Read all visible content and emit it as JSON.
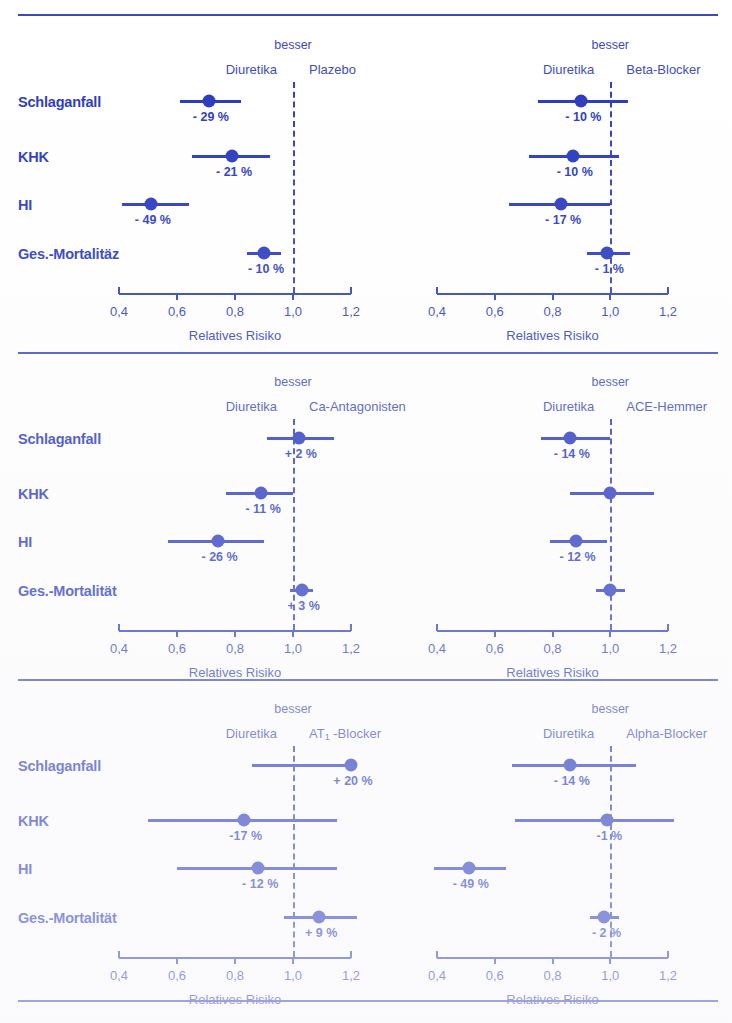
{
  "figure": {
    "x_axis_title": "Relatives Risiko",
    "better_label": "besser",
    "reference_arm": "Diuretika",
    "tick_labels": [
      "0,4",
      "0,6",
      "0,8",
      "1,0",
      "1,2"
    ],
    "tick_values": [
      0.4,
      0.6,
      0.8,
      1.0,
      1.2
    ],
    "outcomes": [
      "Schlaganfall",
      "KHK",
      "HI",
      "Ges.-Mortalität"
    ],
    "accent_color": "#2233bb",
    "text_color": "#3a46bb"
  },
  "chart_data": {
    "type": "scatter",
    "title": "",
    "xlabel": "Relatives Risiko",
    "ylabel": "",
    "xlim": [
      0.35,
      1.28
    ],
    "grid": false,
    "reference_line": 1.0,
    "legend": "none",
    "panels": [
      {
        "id": "panel-plazebo",
        "row": 1,
        "column": "left",
        "comparator": "Plazebo",
        "comparator_sub": "",
        "better_label": "besser",
        "reference_arm": "Diuretika",
        "tick_labels": [
          "0,4",
          "0,6",
          "0,8",
          "1,0",
          "1,2"
        ],
        "xlabel": "Relatives Risiko",
        "rows": [
          {
            "outcome": "Schlaganfall",
            "rr": 0.71,
            "ci_low": 0.61,
            "ci_high": 0.82,
            "label": "- 29 %"
          },
          {
            "outcome": "KHK",
            "rr": 0.79,
            "ci_low": 0.65,
            "ci_high": 0.92,
            "label": "- 21 %"
          },
          {
            "outcome": "HI",
            "rr": 0.51,
            "ci_low": 0.41,
            "ci_high": 0.64,
            "label": "- 49 %"
          },
          {
            "outcome": "Ges.-Mortalitäz",
            "rr": 0.9,
            "ci_low": 0.84,
            "ci_high": 0.96,
            "label": "- 10 %"
          }
        ]
      },
      {
        "id": "panel-beta-blocker",
        "row": 1,
        "column": "right",
        "comparator": "Beta-Blocker",
        "comparator_sub": "",
        "better_label": "besser",
        "reference_arm": "Diuretika",
        "tick_labels": [
          "0,4",
          "0,6",
          "0,8",
          "1,0",
          "1,2"
        ],
        "xlabel": "Relatives Risiko",
        "rows": [
          {
            "outcome": "Schlaganfall",
            "rr": 0.9,
            "ci_low": 0.75,
            "ci_high": 1.06,
            "label": "- 10 %"
          },
          {
            "outcome": "KHK",
            "rr": 0.87,
            "ci_low": 0.72,
            "ci_high": 1.03,
            "label": "- 10 %"
          },
          {
            "outcome": "HI",
            "rr": 0.83,
            "ci_low": 0.65,
            "ci_high": 1.0,
            "label": "- 17 %"
          },
          {
            "outcome": "Ges.-Mortalitäz",
            "rr": 0.99,
            "ci_low": 0.92,
            "ci_high": 1.07,
            "label": "- 1 %"
          }
        ]
      },
      {
        "id": "panel-ca-antagonisten",
        "row": 2,
        "column": "left",
        "comparator": "Ca-Antagonisten",
        "comparator_sub": "",
        "better_label": "besser",
        "reference_arm": "Diuretika",
        "tick_labels": [
          "0,4",
          "0,6",
          "0,8",
          "1,0",
          "1,2"
        ],
        "xlabel": "Relatives Risiko",
        "rows": [
          {
            "outcome": "Schlaganfall",
            "rr": 1.02,
            "ci_low": 0.91,
            "ci_high": 1.14,
            "label": "+ 2 %"
          },
          {
            "outcome": "KHK",
            "rr": 0.89,
            "ci_low": 0.77,
            "ci_high": 1.0,
            "label": "- 11 %"
          },
          {
            "outcome": "HI",
            "rr": 0.74,
            "ci_low": 0.57,
            "ci_high": 0.9,
            "label": "- 26 %"
          },
          {
            "outcome": "Ges.-Mortalität",
            "rr": 1.03,
            "ci_low": 0.99,
            "ci_high": 1.07,
            "label": "+ 3 %"
          }
        ]
      },
      {
        "id": "panel-ace-hemmer",
        "row": 2,
        "column": "right",
        "comparator": "ACE-Hemmer",
        "comparator_sub": "",
        "better_label": "besser",
        "reference_arm": "Diuretika",
        "tick_labels": [
          "0,4",
          "0,6",
          "0,8",
          "1,0",
          "1,2"
        ],
        "xlabel": "Relatives Risiko",
        "rows": [
          {
            "outcome": "Schlaganfall",
            "rr": 0.86,
            "ci_low": 0.76,
            "ci_high": 1.0,
            "label": "- 14 %"
          },
          {
            "outcome": "KHK",
            "rr": 1.0,
            "ci_low": 0.86,
            "ci_high": 1.15,
            "label": ""
          },
          {
            "outcome": "HI",
            "rr": 0.88,
            "ci_low": 0.79,
            "ci_high": 0.99,
            "label": "- 12 %"
          },
          {
            "outcome": "Ges.-Mortalität",
            "rr": 1.0,
            "ci_low": 0.95,
            "ci_high": 1.05,
            "label": ""
          }
        ]
      },
      {
        "id": "panel-at1-blocker",
        "row": 3,
        "column": "left",
        "comparator": "AT",
        "comparator_sub": "1",
        "comparator_tail": " -Blocker",
        "better_label": "besser",
        "reference_arm": "Diuretika",
        "tick_labels": [
          "0,4",
          "0,6",
          "0,8",
          "1,0",
          "1,2"
        ],
        "xlabel": "Relatives Risiko",
        "rows": [
          {
            "outcome": "Schlaganfall",
            "rr": 1.2,
            "ci_low": 0.86,
            "ci_high": 1.21,
            "label": "+ 20 %"
          },
          {
            "outcome": "KHK",
            "rr": 0.83,
            "ci_low": 0.5,
            "ci_high": 1.15,
            "label": "-17 %"
          },
          {
            "outcome": "HI",
            "rr": 0.88,
            "ci_low": 0.6,
            "ci_high": 1.15,
            "label": "- 12 %"
          },
          {
            "outcome": "Ges.-Mortalität",
            "rr": 1.09,
            "ci_low": 0.97,
            "ci_high": 1.22,
            "label": "+ 9 %"
          }
        ]
      },
      {
        "id": "panel-alpha-blocker",
        "row": 3,
        "column": "right",
        "comparator": "Alpha-Blocker",
        "comparator_sub": "",
        "better_label": "besser",
        "reference_arm": "Diuretika",
        "tick_labels": [
          "0,4",
          "0,6",
          "0,8",
          "1,0",
          "1,2"
        ],
        "xlabel": "Relatives Risiko",
        "rows": [
          {
            "outcome": "Schlaganfall",
            "rr": 0.86,
            "ci_low": 0.66,
            "ci_high": 1.09,
            "label": "- 14 %"
          },
          {
            "outcome": "KHK",
            "rr": 0.99,
            "ci_low": 0.67,
            "ci_high": 1.22,
            "label": "-1 %"
          },
          {
            "outcome": "HI",
            "rr": 0.51,
            "ci_low": 0.39,
            "ci_high": 0.64,
            "label": "- 49 %"
          },
          {
            "outcome": "Ges.-Mortalität",
            "rr": 0.98,
            "ci_low": 0.93,
            "ci_high": 1.03,
            "label": "- 2 %"
          }
        ]
      }
    ]
  }
}
